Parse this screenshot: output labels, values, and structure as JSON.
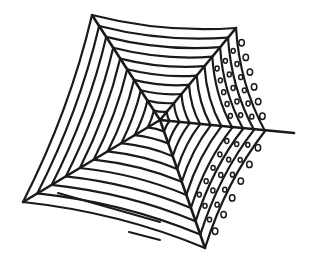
{
  "illustration": {
    "subject": "spider-web",
    "style": "hand-drawn ink line art",
    "alt_text": "Hand-drawn spider web with dew drops",
    "stroke_color": "#1a1a1a",
    "background_color": "#ffffff",
    "center": [
      160,
      120
    ],
    "radials": [
      {
        "name": "top-left",
        "end": [
          92,
          15
        ]
      },
      {
        "name": "top-right",
        "end": [
          236,
          28
        ]
      },
      {
        "name": "right",
        "end": [
          294,
          133
        ]
      },
      {
        "name": "bottom",
        "end": [
          205,
          248
        ]
      },
      {
        "name": "bottom-left",
        "end": [
          23,
          202
        ]
      }
    ],
    "ring_count": 10,
    "extra_strands": [
      {
        "from": [
          58,
          193
        ],
        "to": [
          160,
          222
        ]
      },
      {
        "from": [
          129,
          232
        ],
        "to": [
          160,
          240
        ]
      }
    ],
    "dew_drops": true
  }
}
